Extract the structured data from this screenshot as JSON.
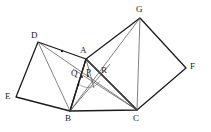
{
  "figure": {
    "stroke_color": "#1c1c1c",
    "thin_stroke_color": "#555555",
    "background_color": "#ffffff",
    "width": 211,
    "height": 132
  },
  "vertices": {
    "A": {
      "label": "A",
      "x": 86,
      "y": 59,
      "label_x": 80,
      "label_y": 46
    },
    "B": {
      "label": "B",
      "x": 70,
      "y": 111,
      "label_x": 66,
      "label_y": 114
    },
    "C": {
      "label": "C",
      "x": 137,
      "y": 110,
      "label_x": 134,
      "label_y": 114
    },
    "D": {
      "label": "D",
      "x": 38,
      "y": 42,
      "label_x": 31,
      "label_y": 31
    },
    "E": {
      "label": "E",
      "x": 16,
      "y": 97,
      "label_x": 6,
      "label_y": 92
    },
    "F": {
      "label": "F",
      "x": 186,
      "y": 68,
      "label_x": 190,
      "label_y": 62
    },
    "G": {
      "label": "G",
      "x": 140,
      "y": 18,
      "label_x": 136,
      "label_y": 5
    },
    "P": {
      "label": "P",
      "x": 90,
      "y": 73,
      "label_x": 86,
      "label_y": 70
    },
    "Q": {
      "label": "Q",
      "x": 79,
      "y": 74,
      "label_x": 72,
      "label_y": 71
    },
    "R": {
      "label": "R",
      "x": 101,
      "y": 71,
      "label_x": 102,
      "label_y": 68
    }
  },
  "segments": {
    "square_left": {
      "name": "square-ADEB",
      "points": "86,59 38,42 16,97 70,111",
      "weight": "thick"
    },
    "square_right": {
      "name": "square-AGFC",
      "points": "86,59 140,18 186,68 137,110",
      "weight": "thick"
    },
    "triangle": {
      "name": "triangle-ABC",
      "points": "86,59 70,111 137,110",
      "weight": "thick"
    },
    "cevians": [
      {
        "name": "segment-D-B",
        "x1": 38,
        "y1": 42,
        "x2": 70,
        "y2": 111,
        "weight": "thin"
      },
      {
        "name": "segment-D-C",
        "x1": 38,
        "y1": 42,
        "x2": 137,
        "y2": 110,
        "weight": "thin"
      },
      {
        "name": "segment-G-B",
        "x1": 140,
        "y1": 18,
        "x2": 70,
        "y2": 111,
        "weight": "thin"
      },
      {
        "name": "segment-G-C",
        "x1": 140,
        "y1": 18,
        "x2": 137,
        "y2": 110,
        "weight": "thin"
      },
      {
        "name": "segment-A-B-extended",
        "x1": 86,
        "y1": 59,
        "x2": 70,
        "y2": 111,
        "weight": "thin"
      },
      {
        "name": "segment-B-R",
        "x1": 70,
        "y1": 111,
        "x2": 108,
        "y2": 66,
        "weight": "thin"
      },
      {
        "name": "segment-C-Q",
        "x1": 137,
        "y1": 110,
        "x2": 74,
        "y2": 70,
        "weight": "thin"
      },
      {
        "name": "segment-C-A",
        "x1": 137,
        "y1": 110,
        "x2": 86,
        "y2": 59,
        "weight": "thin"
      }
    ],
    "midpoint_dots": [
      {
        "name": "midpoint-dot-DA",
        "x": 62,
        "y": 51
      },
      {
        "name": "midpoint-dot-AB",
        "x": 78,
        "y": 85
      },
      {
        "name": "midpoint-dot-Q",
        "x": 82,
        "y": 77
      },
      {
        "name": "midpoint-dot-P",
        "x": 88,
        "y": 76
      }
    ],
    "angle_arc": {
      "name": "angle-arc-at-P",
      "path": "M 79 84 A 13 13 0 0 0 99 82"
    }
  }
}
